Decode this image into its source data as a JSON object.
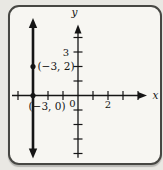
{
  "figure": {
    "background_outer": "#e9e8e3",
    "background_inner": "#f7f6f2",
    "border_color": "#474743",
    "ink_color": "#151515"
  },
  "chart_data": {
    "type": "line",
    "title": "",
    "xlabel": "x",
    "ylabel": "y",
    "origin_label": "0",
    "xlim": [
      -4.4,
      4.6
    ],
    "ylim": [
      -4.3,
      4.9
    ],
    "grid": false,
    "x_ticks": [
      -4,
      -3,
      -2,
      -1,
      1,
      2,
      3,
      4
    ],
    "y_ticks": [
      -4,
      -3,
      -2,
      -1,
      1,
      2,
      3,
      4
    ],
    "x_tick_labels": [
      {
        "value": 2,
        "label": "2"
      }
    ],
    "y_tick_labels": [
      {
        "value": 3,
        "label": "3"
      }
    ],
    "series": [
      {
        "name": "vertical-line",
        "equation": "x = -3",
        "points": [
          [
            -3,
            -4.35
          ],
          [
            -3,
            5.35
          ]
        ],
        "arrow_both_ends": true,
        "stroke_width": 2.6
      }
    ],
    "marked_points": [
      {
        "x": -3,
        "y": 2,
        "label": "(−3, 2)",
        "label_side": "right"
      },
      {
        "x": -3,
        "y": 0,
        "label": "(−3, 0)",
        "label_side": "below-left"
      }
    ],
    "layout": {
      "origin_px": [
        78,
        95.5
      ],
      "unit_px": [
        15,
        14.5
      ],
      "axis_stroke": 1.3,
      "tick_half": 4.5
    }
  }
}
